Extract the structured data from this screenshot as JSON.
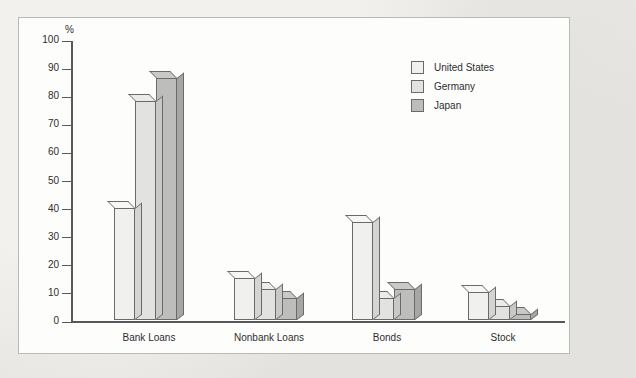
{
  "chart_data": {
    "type": "bar",
    "title": "",
    "subtitle": "",
    "xlabel": "",
    "ylabel": "%",
    "ylim": [
      0,
      100
    ],
    "ytick_step": 10,
    "yticks": [
      "100",
      "90",
      "80",
      "70",
      "60",
      "50",
      "40",
      "30",
      "20",
      "10",
      "0"
    ],
    "grid": false,
    "legend_position": "top-right",
    "categories": [
      "Bank Loans",
      "Nonbank Loans",
      "Bonds",
      "Stock"
    ],
    "series": [
      {
        "name": "United States",
        "color": "#f0f0ee",
        "values": [
          40,
          15,
          35,
          10
        ]
      },
      {
        "name": "Germany",
        "color": "#e2e2e0",
        "values": [
          78,
          11,
          8,
          5
        ]
      },
      {
        "name": "Japan",
        "color": "#bdbdbb",
        "values": [
          86,
          8,
          11,
          2
        ]
      }
    ],
    "series_side_colors": [
      "#d4d4d2",
      "#c8c8c6",
      "#a6a6a4"
    ],
    "series_top_colors": [
      "#f7f7f5",
      "#ebebe9",
      "#c9c9c7"
    ]
  }
}
